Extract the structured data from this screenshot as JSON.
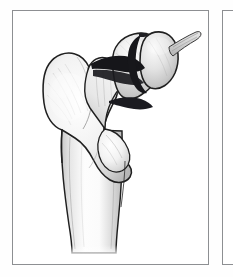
{
  "figure": {
    "panels": [
      {
        "id": "panel-a",
        "label": "",
        "illustration": {
          "name": "proximal-femur-fracture-illustration",
          "view": "anterior",
          "subject": "left proximal femur",
          "style": "pencil-shaded line drawing, grayscale",
          "structures": [
            {
              "name": "femoral-head",
              "description": "rounded articular head, superolateral, split by fracture"
            },
            {
              "name": "femoral-neck",
              "description": "short neck segment between head and trochanters"
            },
            {
              "name": "greater-trochanter",
              "description": "large lateral prominence, superior-lateral"
            },
            {
              "name": "lesser-trochanter",
              "description": "smaller medial prominence, inferomedial to neck"
            },
            {
              "name": "intertrochanteric-region",
              "description": "region spanning between trochanters"
            },
            {
              "name": "femoral-shaft",
              "description": "tapering diaphysis extending inferiorly"
            },
            {
              "name": "fracture-line-subcapital",
              "description": "dark transverse break across femoral neck below head"
            },
            {
              "name": "fracture-line-head-split",
              "description": "dark oblique break through the femoral head"
            },
            {
              "name": "ligamentum-teres-stump",
              "description": "band projecting superolaterally from head"
            },
            {
              "name": "trabecular-shading",
              "description": "fine internal cancellous bone hatching"
            }
          ],
          "colors": {
            "outline": "#1d1d1d",
            "bone_fill_light": "#fbfbfb",
            "bone_fill_mid": "#dedede",
            "bone_fill_shadow": "#b9b9b9",
            "fracture_dark": "#15151a",
            "panel_border": "#8d8f92",
            "background": "#ffffff"
          }
        }
      },
      {
        "id": "panel-b",
        "label": "",
        "illustration": {
          "name": "adjacent-figure-panel",
          "view": "",
          "subject": "partially visible neighbouring panel at right edge",
          "style": "empty white panel",
          "structures": [],
          "colors": {
            "panel_border": "#8d8f92",
            "background": "#ffffff"
          }
        }
      }
    ]
  }
}
